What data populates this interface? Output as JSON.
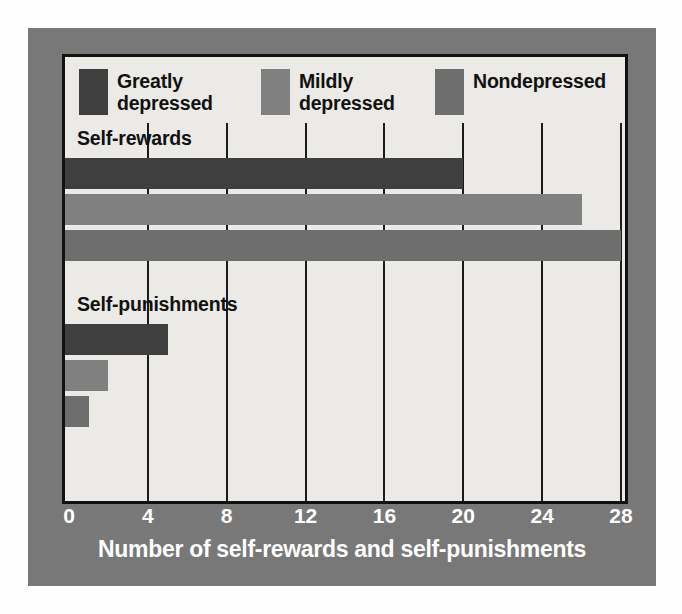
{
  "chart_data": {
    "type": "bar",
    "orientation": "horizontal",
    "title": "",
    "xlabel": "Number of self-rewards and self-punishments",
    "ylabel": "",
    "xlim": [
      0,
      28
    ],
    "xticks": [
      "0",
      "4",
      "8",
      "12",
      "16",
      "20",
      "24",
      "28"
    ],
    "xtick_values": [
      0,
      4,
      8,
      12,
      16,
      20,
      24,
      28
    ],
    "grid": true,
    "legend_position": "top",
    "categories": [
      "Self-rewards",
      "Self-punishments"
    ],
    "series": [
      {
        "name": "Greatly\ndepressed",
        "label": "Greatly depressed",
        "color": "#3f3f3f",
        "values": [
          20,
          5
        ]
      },
      {
        "name": "Mildly\ndepressed",
        "label": "Mildly depressed",
        "color": "#808080",
        "values": [
          26,
          2
        ]
      },
      {
        "name": "Nondepressed",
        "label": "Nondepressed",
        "color": "#6e6e6e",
        "values": [
          28,
          1
        ]
      }
    ]
  },
  "legend": {
    "items": [
      {
        "label": "Greatly\ndepressed",
        "color": "#3f3f3f"
      },
      {
        "label": "Mildly\ndepressed",
        "color": "#808080"
      },
      {
        "label": "Nondepressed",
        "color": "#6e6e6e"
      }
    ]
  },
  "groups": [
    {
      "label": "Self-rewards"
    },
    {
      "label": "Self-punishments"
    }
  ],
  "axis": {
    "ticks": [
      "0",
      "4",
      "8",
      "12",
      "16",
      "20",
      "24",
      "28"
    ],
    "label": "Number of self-rewards and self-punishments"
  },
  "colors": {
    "frame": "#787878",
    "panel": "#eceae6",
    "border": "#111111",
    "gridline": "#1b1b1b",
    "tick_text": "#ffffff"
  }
}
